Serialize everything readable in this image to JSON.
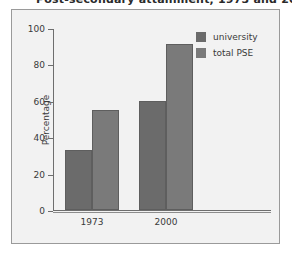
{
  "title": {
    "text": "Post-secondary attainment, 1973 and 2000",
    "clipped": true
  },
  "legend": {
    "position": "top-right",
    "items": [
      {
        "label": "university",
        "color": "#6b6b6b",
        "icon": "legend-swatch-icon"
      },
      {
        "label": "total PSE",
        "color": "#7a7a7a",
        "icon": "legend-swatch-icon"
      }
    ]
  },
  "chart_data": {
    "type": "bar",
    "title": "Post-secondary attainment, 1973 and 2000",
    "xlabel": "",
    "ylabel": "Percentage",
    "ylim": [
      0,
      100
    ],
    "yticks": [
      0,
      20,
      40,
      60,
      80,
      100
    ],
    "categories": [
      "1973",
      "2000"
    ],
    "grid": false,
    "legend_position": "top-right",
    "series": [
      {
        "name": "university",
        "color": "#6b6b6b",
        "values": [
          33,
          60
        ]
      },
      {
        "name": "total PSE",
        "color": "#7a7a7a",
        "values": [
          55,
          91
        ]
      }
    ]
  }
}
